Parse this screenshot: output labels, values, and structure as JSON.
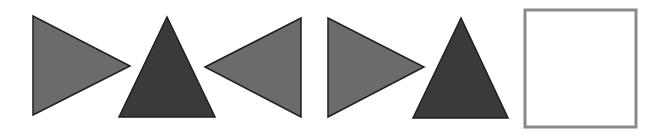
{
  "diagram": {
    "type": "shape-sequence",
    "background": "#ffffff",
    "shapes": [
      {
        "kind": "triangle",
        "direction": "right",
        "fill": "#6b6b6b",
        "stroke": "#1e1e1e",
        "points": "33,16 33,115 130,66"
      },
      {
        "kind": "triangle",
        "direction": "up",
        "fill": "#3a3a3a",
        "stroke": "#1e1e1e",
        "points": "167,17 119,117 215,117"
      },
      {
        "kind": "triangle",
        "direction": "left",
        "fill": "#6b6b6b",
        "stroke": "#1e1e1e",
        "points": "205,67 301,18 301,117"
      },
      {
        "kind": "triangle",
        "direction": "right",
        "fill": "#6b6b6b",
        "stroke": "#1e1e1e",
        "points": "328,18 328,117 424,67"
      },
      {
        "kind": "triangle",
        "direction": "up",
        "fill": "#3a3a3a",
        "stroke": "#1e1e1e",
        "points": "461,18 413,118 508,118"
      },
      {
        "kind": "square",
        "state": "empty",
        "fill": "#ffffff",
        "stroke": "#8a8a8a",
        "x": 525,
        "y": 10,
        "width": 111,
        "height": 117
      }
    ]
  }
}
